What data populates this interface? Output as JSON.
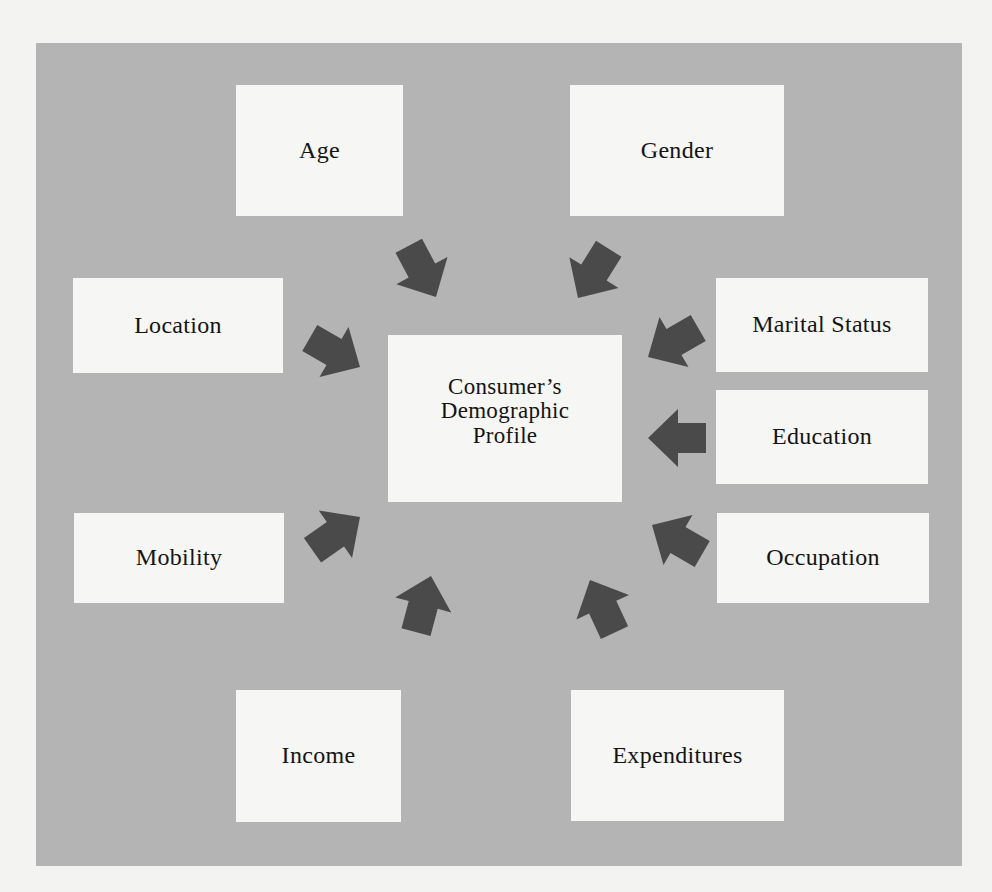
{
  "diagram": {
    "type": "hub-and-spoke",
    "center": {
      "label": "Consumer’s\nDemographic\nProfile"
    },
    "factors": [
      {
        "id": "age",
        "label": "Age"
      },
      {
        "id": "gender",
        "label": "Gender"
      },
      {
        "id": "location",
        "label": "Location"
      },
      {
        "id": "marital-status",
        "label": "Marital Status"
      },
      {
        "id": "education",
        "label": "Education"
      },
      {
        "id": "occupation",
        "label": "Occupation"
      },
      {
        "id": "mobility",
        "label": "Mobility"
      },
      {
        "id": "income",
        "label": "Income"
      },
      {
        "id": "expenditures",
        "label": "Expenditures"
      }
    ],
    "arrow_direction": "inward-to-center",
    "colors": {
      "page_background": "#f3f3f1",
      "panel_background": "#b4b4b4",
      "box_fill": "#f6f6f4",
      "arrow_fill": "#4a4a4a",
      "text": "#141414"
    }
  }
}
